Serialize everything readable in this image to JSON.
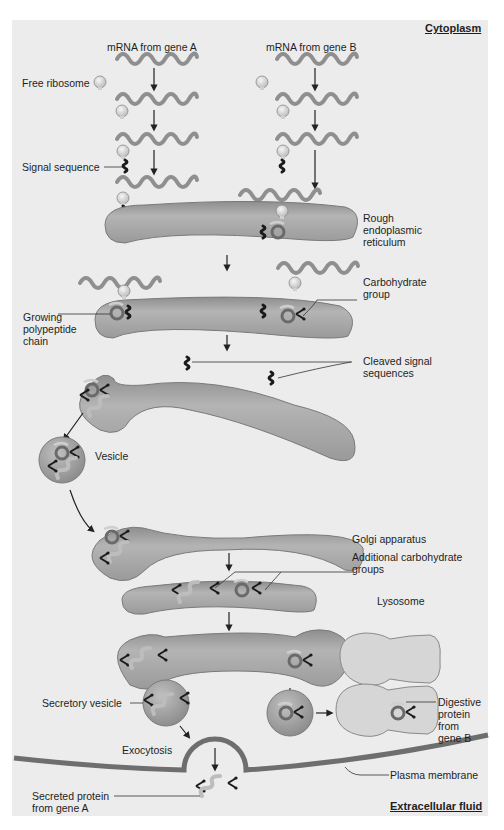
{
  "regions": {
    "top": "Cytoplasm",
    "bottom": "Extracellular fluid"
  },
  "headers": {
    "gene_a": "mRNA from gene A",
    "gene_b": "mRNA from gene B"
  },
  "labels": {
    "free_ribosome": "Free ribosome",
    "signal_sequence": "Signal sequence",
    "rough_er_1": "Rough",
    "rough_er_2": "endoplasmic",
    "rough_er_3": "reticulum",
    "carbohydrate_1": "Carbohydrate",
    "carbohydrate_2": "group",
    "growing_1": "Growing",
    "growing_2": "polypeptide",
    "growing_3": "chain",
    "cleaved_1": "Cleaved signal",
    "cleaved_2": "sequences",
    "vesicle": "Vesicle",
    "golgi": "Golgi apparatus",
    "additional_1": "Additional carbohydrate",
    "additional_2": "groups",
    "lysosome": "Lysosome",
    "secretory_vesicle": "Secretory vesicle",
    "digestive_1": "Digestive",
    "digestive_2": "protein",
    "digestive_3": "from",
    "digestive_4": "gene B",
    "exocytosis": "Exocytosis",
    "plasma_membrane": "Plasma membrane",
    "secreted_1": "Secreted protein",
    "secreted_2": "from gene A"
  },
  "colors": {
    "panel_bg": "#ececec",
    "organelle_fill": "#a9a9a9",
    "organelle_edge": "#7a7a7a",
    "lysosome_fill": "#d6d6d6",
    "mrna": "#8f8f8f",
    "ribosome": "#e2e2e2",
    "signal": "#1a1a1a",
    "membrane": "#6e6e6e"
  }
}
